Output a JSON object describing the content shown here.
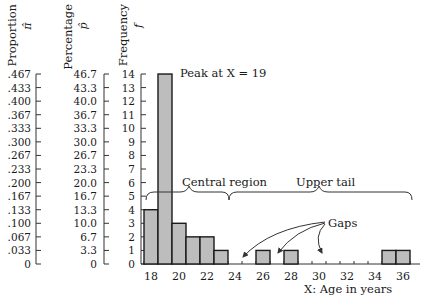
{
  "chart_data": {
    "type": "bar",
    "title": "",
    "xlabel": "X:   Age in years",
    "ylabel": "Frequency f",
    "axes": [
      {
        "label": "Proportion",
        "symbol": "π̂",
        "ticks": [
          ".467",
          ".433",
          ".400",
          ".367",
          ".333",
          ".300",
          ".267",
          ".233",
          ".200",
          ".167",
          ".133",
          ".100",
          ".067",
          ".033",
          "0"
        ]
      },
      {
        "label": "Percentage",
        "symbol": "p̂",
        "ticks": [
          "46.7",
          "43.3",
          "40.0",
          "36.7",
          "33.3",
          "30.0",
          "26.7",
          "23.3",
          "20.0",
          "16.7",
          "13.3",
          "10.0",
          "6.7",
          "3.3",
          "0"
        ]
      },
      {
        "label": "Frequency",
        "symbol": "f",
        "ticks": [
          "14",
          "13",
          "12",
          "11",
          "10",
          "9",
          "8",
          "7",
          "6",
          "5",
          "4",
          "3",
          "2",
          "1",
          "0"
        ]
      }
    ],
    "categories": [
      18,
      19,
      20,
      21,
      22,
      23,
      24,
      25,
      26,
      27,
      28,
      29,
      30,
      31,
      32,
      33,
      34,
      35,
      36
    ],
    "values": [
      4,
      14,
      3,
      2,
      2,
      1,
      0,
      0,
      1,
      0,
      1,
      0,
      0,
      0,
      0,
      0,
      0,
      1,
      1
    ],
    "x_tick_labels": [
      "18",
      "20",
      "22",
      "24",
      "26",
      "28",
      "30",
      "32",
      "34",
      "36"
    ],
    "ylim": [
      0,
      14
    ],
    "grid": false,
    "annotations": {
      "peak": "Peak at X = 19",
      "central": "Central region",
      "upper": "Upper tail",
      "gaps": "Gaps"
    }
  }
}
